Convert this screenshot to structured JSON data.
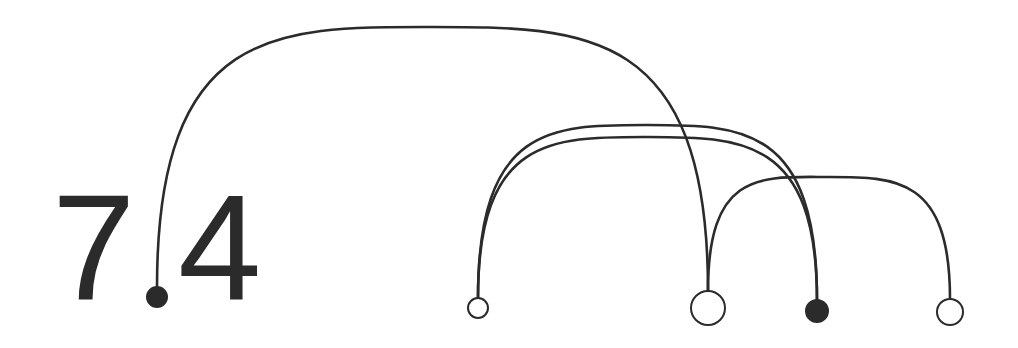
{
  "colors": {
    "background": "#ffffff",
    "stroke": "#2b2b2b",
    "filled": "#2b2b2b",
    "open": "#ffffff"
  },
  "labels": [
    {
      "id": "digit-left",
      "text": "7",
      "x": 52,
      "y": 172
    },
    {
      "id": "digit-right",
      "text": "4",
      "x": 178,
      "y": 172
    }
  ],
  "nodes": [
    {
      "id": "A",
      "cx": 157,
      "cy": 297,
      "r": 10,
      "filled": true
    },
    {
      "id": "B",
      "cx": 478,
      "cy": 308,
      "r": 10,
      "filled": false
    },
    {
      "id": "C",
      "cx": 708,
      "cy": 308,
      "r": 17,
      "filled": false
    },
    {
      "id": "D",
      "cx": 817,
      "cy": 311,
      "r": 11,
      "filled": true
    },
    {
      "id": "E",
      "cx": 950,
      "cy": 312,
      "r": 13,
      "filled": false
    }
  ],
  "arcs": [
    {
      "id": "A-C",
      "from": "A",
      "to": "C",
      "peak_y": 27
    },
    {
      "id": "B-D-outer",
      "from": "B",
      "to": "D",
      "peak_y": 125
    },
    {
      "id": "B-D-inner",
      "from": "B",
      "to": "D",
      "peak_y": 137
    },
    {
      "id": "C-E",
      "from": "C",
      "to": "E",
      "peak_y": 177
    }
  ]
}
